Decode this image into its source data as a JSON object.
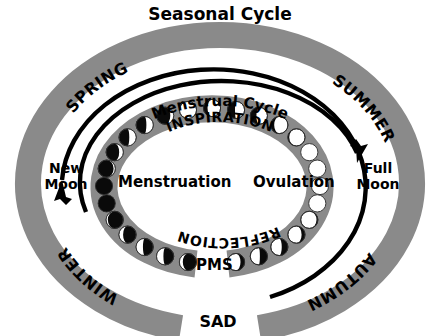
{
  "title": "Seasonal Cycle",
  "colors": {
    "band_gray": "#8a8a8a",
    "ring_gray": "#8a8a8a",
    "ink": "#000000",
    "background": "#ffffff",
    "moon_light": "#ffffff",
    "moon_dark": "#0a0a0a"
  },
  "seasonal_ring": {
    "label": "Seasonal Cycle",
    "seasons": [
      {
        "name": "SPRING",
        "position": "upper-left"
      },
      {
        "name": "SUMMER",
        "position": "upper-right"
      },
      {
        "name": "AUTUMN",
        "position": "lower-right"
      },
      {
        "name": "WINTER",
        "position": "lower-left"
      }
    ],
    "bottom_gap_label": "SAD"
  },
  "menstrual_ring": {
    "label": "Menstrual Cycle",
    "phases_top": "INSPIRATION",
    "phases_bottom": "REFLECTION",
    "events": [
      {
        "name": "Menstruation",
        "position": "left-inner"
      },
      {
        "name": "Ovulation",
        "position": "right-inner"
      },
      {
        "name": "PMS",
        "position": "bottom-inner"
      }
    ]
  },
  "moon_labels": {
    "new_moon_line1": "New",
    "new_moon_line2": "Moon",
    "full_moon_line1": "Full",
    "full_moon_line2": "Moon"
  },
  "moon_phases": {
    "count": 28,
    "description": "Ring of moon phase discs progressing from new moon (left) clockwise through waxing phases (top) to full moon (right) and waning phases (bottom) back to new moon.",
    "sequence_illumination": [
      0.0,
      0.05,
      0.12,
      0.2,
      0.3,
      0.4,
      0.5,
      0.62,
      0.72,
      0.82,
      0.9,
      0.96,
      1.0,
      1.0,
      1.0,
      1.0,
      0.96,
      0.9,
      0.82,
      0.72,
      0.62,
      0.5,
      0.4,
      0.3,
      0.2,
      0.12,
      0.05,
      0.0
    ]
  },
  "chart_data": {
    "type": "pie",
    "title": "Seasonal Cycle",
    "categories": [
      "SPRING",
      "SUMMER",
      "AUTUMN",
      "WINTER"
    ],
    "values": [
      25,
      25,
      25,
      25
    ],
    "annotations": [
      "Menstrual Cycle",
      "INSPIRATION",
      "REFLECTION",
      "Menstruation",
      "Ovulation",
      "PMS",
      "New Moon",
      "Full Moon",
      "SAD"
    ],
    "xlabel": "",
    "ylabel": "",
    "legend": "none",
    "grid": false
  }
}
